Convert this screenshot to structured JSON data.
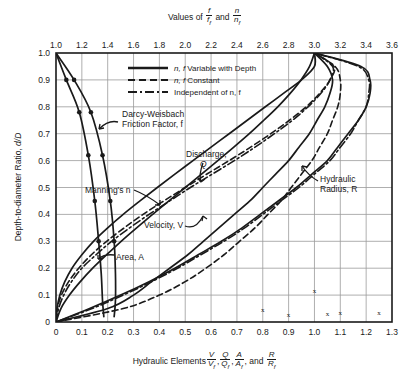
{
  "figure": {
    "top_axis": {
      "title_prefix": "Values of",
      "title_frac1_num": "f",
      "title_frac1_den": "f",
      "title_frac1_den_sub": "f",
      "title_conj": "and",
      "title_frac2_num": "n",
      "title_frac2_den": "n",
      "title_frac2_den_sub": "f",
      "ticks": [
        "1.0",
        "1.2",
        "1.4",
        "1.6",
        "1.8",
        "2.0",
        "2.2",
        "2.4",
        "2.6",
        "2.8",
        "3.0",
        "3.2",
        "3.4",
        "3.6"
      ],
      "range": [
        1.0,
        3.6
      ]
    },
    "bottom_axis": {
      "title_prefix": "Hydraulic Elements",
      "title_and": "and",
      "fracs": [
        {
          "num": "V",
          "den": "V",
          "den_sub": "f",
          "sep": ","
        },
        {
          "num": "Q",
          "den": "Q",
          "den_sub": "f",
          "sep": ","
        },
        {
          "num": "A",
          "den": "A",
          "den_sub": "f",
          "sep": ","
        },
        {
          "num": "R",
          "den": "R",
          "den_sub": "f",
          "sep": ""
        }
      ],
      "ticks": [
        "0",
        "0.1",
        "0.2",
        "0.3",
        "0.4",
        "0.5",
        "0.6",
        "0.7",
        "0.8",
        "0.9",
        "1.0",
        "1.1",
        "1.2",
        "1.3"
      ],
      "range": [
        0,
        1.3
      ]
    },
    "y_axis": {
      "title": "Depth-to-diameter Ratio,",
      "title_symbol": "d/D",
      "ticks": [
        "0",
        "0.1",
        "0.2",
        "0.3",
        "0.4",
        "0.5",
        "0.6",
        "0.7",
        "0.8",
        "0.9",
        "1.0"
      ],
      "range": [
        0,
        1.0
      ]
    },
    "legend": [
      {
        "style": "solid",
        "label_italic": "n, f",
        "label": "Variable with Depth"
      },
      {
        "style": "dashed",
        "label_italic": "n, f",
        "label": "Constant"
      },
      {
        "style": "dashdot",
        "label_italic": "",
        "label": "Independent of n, f"
      }
    ],
    "annotations": [
      {
        "id": "darcy",
        "line1": "Darcy-Weisbach",
        "line2": "Friction Factor, f"
      },
      {
        "id": "discharge",
        "line1": "Discharge,",
        "line2": "Q"
      },
      {
        "id": "mannings",
        "line1": "Manning's n",
        "line2": ""
      },
      {
        "id": "velocity",
        "line1": "Velocity, V",
        "line2": ""
      },
      {
        "id": "area",
        "line1": "Area, A",
        "line2": ""
      },
      {
        "id": "hydraulic_radius",
        "line1": "Hydraulic",
        "line2": "Radius, R"
      }
    ],
    "colors": {
      "ink": "#1a1a1a",
      "grid": "#9a9a9a",
      "background": "#ffffff"
    }
  },
  "chart_data": {
    "type": "line",
    "xlabel": "Hydraulic Elements V/Vf, Q/Qf, A/Af, and R/Rf",
    "ylabel": "Depth-to-diameter Ratio, d/D",
    "xlim": [
      0,
      1.3
    ],
    "ylim": [
      0,
      1.0
    ],
    "x2label": "Values of f/ff and n/nf",
    "x2lim": [
      1.0,
      3.6
    ],
    "grid": true,
    "legend_position": "top-center",
    "series": [
      {
        "name": "Darcy-Weisbach Friction Factor, f",
        "style": "solid",
        "axis": "top",
        "x": [
          1.0,
          1.08,
          1.18,
          1.25,
          1.3,
          1.33,
          1.35,
          1.36,
          1.37
        ],
        "y": [
          1.0,
          0.9,
          0.78,
          0.62,
          0.45,
          0.3,
          0.18,
          0.08,
          0.02
        ]
      },
      {
        "name": "Manning's n (variable with depth)",
        "style": "solid",
        "axis": "top",
        "x": [
          1.0,
          1.14,
          1.27,
          1.36,
          1.42,
          1.45,
          1.46,
          1.46,
          1.45
        ],
        "y": [
          1.0,
          0.9,
          0.78,
          0.62,
          0.45,
          0.3,
          0.18,
          0.08,
          0.02
        ]
      },
      {
        "name": "Area, A (A/Af)",
        "style": "solid",
        "axis": "bottom",
        "x": [
          0.0,
          0.019,
          0.052,
          0.094,
          0.142,
          0.196,
          0.252,
          0.312,
          0.374,
          0.437,
          0.5,
          0.563,
          0.626,
          0.688,
          0.748,
          0.804,
          0.858,
          0.906,
          0.948,
          0.981,
          1.0
        ],
        "y": [
          0.0,
          0.05,
          0.1,
          0.15,
          0.2,
          0.25,
          0.3,
          0.35,
          0.4,
          0.45,
          0.5,
          0.55,
          0.6,
          0.65,
          0.7,
          0.75,
          0.8,
          0.85,
          0.9,
          0.95,
          1.0
        ]
      },
      {
        "name": "Hydraulic Radius, R (R/Rf)",
        "style": "solid",
        "axis": "bottom",
        "x": [
          0.0,
          0.13,
          0.25,
          0.36,
          0.46,
          0.55,
          0.64,
          0.72,
          0.79,
          0.86,
          0.93,
          0.99,
          1.05,
          1.09,
          1.13,
          1.17,
          1.2,
          1.215,
          1.215,
          1.18,
          1.0
        ],
        "y": [
          0.0,
          0.05,
          0.1,
          0.15,
          0.2,
          0.25,
          0.3,
          0.35,
          0.4,
          0.45,
          0.5,
          0.55,
          0.6,
          0.65,
          0.7,
          0.75,
          0.8,
          0.85,
          0.9,
          0.95,
          1.0
        ]
      },
      {
        "name": "Discharge, Q (Q/Qf) n,f variable with depth",
        "style": "solid",
        "axis": "bottom",
        "x": [
          0.0,
          0.004,
          0.015,
          0.034,
          0.062,
          0.1,
          0.145,
          0.2,
          0.26,
          0.325,
          0.392,
          0.46,
          0.53,
          0.6,
          0.67,
          0.74,
          0.81,
          0.88,
          0.95,
          1.0,
          1.0
        ],
        "y": [
          0.0,
          0.05,
          0.1,
          0.15,
          0.2,
          0.25,
          0.3,
          0.35,
          0.4,
          0.45,
          0.5,
          0.55,
          0.6,
          0.65,
          0.7,
          0.75,
          0.8,
          0.85,
          0.9,
          0.95,
          1.0
        ]
      },
      {
        "name": "Discharge, Q (Q/Qf) n,f constant",
        "style": "dashed",
        "axis": "bottom",
        "x": [
          0.0,
          0.005,
          0.021,
          0.049,
          0.088,
          0.137,
          0.196,
          0.264,
          0.337,
          0.417,
          0.5,
          0.584,
          0.67,
          0.753,
          0.831,
          0.903,
          0.968,
          1.02,
          1.06,
          1.075,
          1.0
        ],
        "y": [
          0.0,
          0.05,
          0.1,
          0.15,
          0.2,
          0.25,
          0.3,
          0.35,
          0.4,
          0.45,
          0.5,
          0.55,
          0.6,
          0.65,
          0.7,
          0.75,
          0.8,
          0.85,
          0.9,
          0.95,
          1.0
        ]
      },
      {
        "name": "Velocity, V (V/Vf) n,f variable with depth",
        "style": "solid",
        "axis": "bottom",
        "x": [
          0.0,
          0.2,
          0.3,
          0.37,
          0.44,
          0.51,
          0.57,
          0.63,
          0.69,
          0.75,
          0.8,
          0.85,
          0.9,
          0.94,
          0.98,
          1.01,
          1.04,
          1.06,
          1.07,
          1.05,
          1.0
        ],
        "y": [
          0.0,
          0.05,
          0.1,
          0.15,
          0.2,
          0.25,
          0.3,
          0.35,
          0.4,
          0.45,
          0.5,
          0.55,
          0.6,
          0.65,
          0.7,
          0.75,
          0.8,
          0.85,
          0.9,
          0.95,
          1.0
        ]
      },
      {
        "name": "Velocity, V (V/Vf) n,f constant",
        "style": "dashed",
        "axis": "bottom",
        "x": [
          0.0,
          0.26,
          0.4,
          0.5,
          0.58,
          0.65,
          0.71,
          0.77,
          0.82,
          0.87,
          0.91,
          0.95,
          0.99,
          1.02,
          1.05,
          1.07,
          1.09,
          1.1,
          1.1,
          1.08,
          1.0
        ],
        "y": [
          0.0,
          0.05,
          0.1,
          0.15,
          0.2,
          0.25,
          0.3,
          0.35,
          0.4,
          0.45,
          0.5,
          0.55,
          0.6,
          0.65,
          0.7,
          0.75,
          0.8,
          0.85,
          0.9,
          0.95,
          1.0
        ]
      },
      {
        "name": "Independent of n,f (R/Rf)",
        "style": "dashdot",
        "axis": "bottom",
        "x": [
          0.0,
          0.14,
          0.26,
          0.37,
          0.47,
          0.56,
          0.65,
          0.73,
          0.8,
          0.87,
          0.94,
          1.0,
          1.06,
          1.1,
          1.14,
          1.17,
          1.2,
          1.21,
          1.21,
          1.17,
          1.0
        ],
        "y": [
          0.0,
          0.05,
          0.1,
          0.15,
          0.2,
          0.25,
          0.3,
          0.35,
          0.4,
          0.45,
          0.5,
          0.55,
          0.6,
          0.65,
          0.7,
          0.75,
          0.8,
          0.85,
          0.9,
          0.95,
          1.0
        ]
      },
      {
        "name": "Independent of n,f (Q/Qf)",
        "style": "dashdot",
        "axis": "bottom",
        "x": [
          0.0,
          0.01,
          0.03,
          0.06,
          0.1,
          0.155,
          0.215,
          0.285,
          0.36,
          0.44,
          0.52,
          0.605,
          0.69,
          0.77,
          0.845,
          0.915,
          0.975,
          1.025,
          1.06,
          1.07,
          1.0
        ],
        "y": [
          0.0,
          0.05,
          0.1,
          0.15,
          0.2,
          0.25,
          0.3,
          0.35,
          0.4,
          0.45,
          0.5,
          0.55,
          0.6,
          0.65,
          0.7,
          0.75,
          0.8,
          0.85,
          0.9,
          0.95,
          1.0
        ]
      }
    ]
  }
}
